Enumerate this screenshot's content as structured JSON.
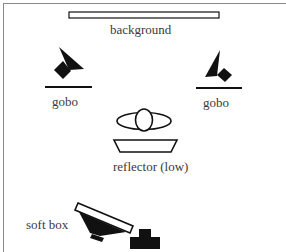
{
  "diagram": {
    "colors": {
      "ink": "#111111",
      "frame": "#8a8a8a",
      "text": "#3a3a3a"
    },
    "labels": {
      "background": "background",
      "gobo_left": "gobo",
      "gobo_right": "gobo",
      "reflector": "reflector (low)",
      "soft_box": "soft box"
    },
    "elements": [
      {
        "id": "background",
        "shape": "outlined-rectangle"
      },
      {
        "id": "gobo-left",
        "shape": "light-with-gobo-bar"
      },
      {
        "id": "gobo-right",
        "shape": "light-with-gobo-bar"
      },
      {
        "id": "subject",
        "shape": "head-shoulders-top-view"
      },
      {
        "id": "reflector",
        "shape": "trapezoid"
      },
      {
        "id": "soft-box",
        "shape": "softbox-light"
      },
      {
        "id": "camera",
        "shape": "camera-block"
      }
    ]
  }
}
